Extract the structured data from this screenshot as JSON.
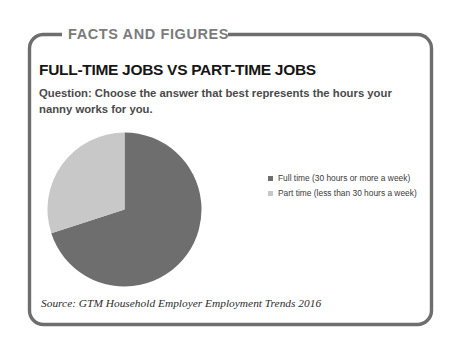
{
  "card": {
    "banner_label": "FACTS AND FIGURES",
    "title": "FULL-TIME JOBS VS PART-TIME JOBS",
    "question": "Question: Choose the answer that best represents the hours your nanny works for you.",
    "source": "Source: GTM Household Employer Employment Trends 2016",
    "frame_color": "#6e6e6e",
    "banner_color": "#7b7b7b",
    "title_color": "#161616",
    "question_color": "#4a4a4a"
  },
  "chart_data": {
    "type": "pie",
    "title": "FULL-TIME JOBS VS PART-TIME JOBS",
    "subtitle": "Question: Choose the answer that best represents the hours your nanny works for you.",
    "categories": [
      "Full time (30 hours or more a week)",
      "Part time (less than 30 hours a week)"
    ],
    "values": [
      70,
      30
    ],
    "colors": [
      "#6e6e6e",
      "#c8c8c8"
    ],
    "legend_position": "right",
    "start_angle_deg": 0,
    "direction": "clockwise",
    "slices": [
      {
        "label": "Full time (30 hours or more a week)",
        "value": 70,
        "color": "#6e6e6e",
        "start_deg": 0,
        "end_deg": 251
      },
      {
        "label": "Part time (less than 30 hours a week)",
        "value": 30,
        "color": "#c8c8c8",
        "start_deg": 251,
        "end_deg": 360
      }
    ]
  },
  "legend": {
    "items": [
      {
        "label": "Full time (30 hours or more a week)",
        "color": "#6e6e6e"
      },
      {
        "label": "Part time (less than 30 hours a week)",
        "color": "#c8c8c8"
      }
    ]
  }
}
